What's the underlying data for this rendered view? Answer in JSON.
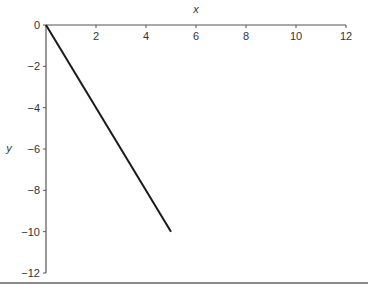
{
  "chart_data": {
    "type": "line",
    "title": "",
    "xlabel": "x",
    "ylabel": "y",
    "xlim": [
      0,
      12
    ],
    "ylim": [
      -12,
      0
    ],
    "x_ticks": [
      2,
      4,
      6,
      8,
      10,
      12
    ],
    "y_ticks": [
      0,
      -2,
      -4,
      -6,
      -8,
      -10,
      -12
    ],
    "x_tick_labels": [
      "2",
      "4",
      "6",
      "8",
      "10",
      "12"
    ],
    "y_tick_labels": [
      "0",
      "−2",
      "−4",
      "−6",
      "−8",
      "−10",
      "−12"
    ],
    "grid": false,
    "legend": null,
    "x_axis_position": "top",
    "series": [
      {
        "name": "line",
        "x": [
          0,
          5
        ],
        "y": [
          0,
          -10
        ],
        "color": "#1a1a1a"
      }
    ]
  }
}
